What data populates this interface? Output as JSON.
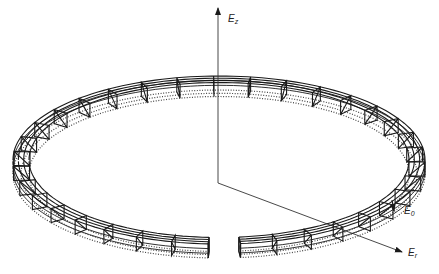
{
  "figure": {
    "colors": {
      "background": "#ffffff",
      "ink": "#1a1a1a",
      "axis": "#333333",
      "dotted": "#444444"
    }
  },
  "axes": {
    "origin": [
      218,
      183
    ],
    "z": {
      "label": "E",
      "subscript": "z",
      "tip": [
        218,
        8
      ],
      "label_pos": [
        228,
        22
      ]
    },
    "r": {
      "label": "E",
      "subscript": "r",
      "tip": [
        402,
        252
      ],
      "label_pos": [
        408,
        256
      ]
    },
    "theta": {
      "label": "E",
      "subscript": "0",
      "tip": [
        394,
        211
      ],
      "from": [
        392,
        200
      ],
      "label_pos": [
        404,
        214
      ]
    }
  },
  "ring": {
    "center": [
      219,
      160
    ],
    "outer_rx": 206,
    "outer_ry": 84,
    "band_width": 16,
    "depth": 14,
    "layers_solid": 4,
    "layers_dotted": 3,
    "gap_start_deg": 84,
    "gap_end_deg": 93,
    "frame_count": 34
  }
}
